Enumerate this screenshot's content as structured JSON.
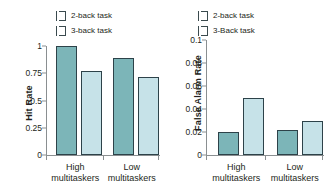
{
  "chart_data": [
    {
      "id": "hit-rate",
      "type": "bar",
      "title": "",
      "xlabel": "",
      "ylabel": "Hit Rate",
      "categories": [
        "High multitaskers",
        "Low multitaskers"
      ],
      "category_lines": [
        [
          "High",
          "multitaskers"
        ],
        [
          "Low",
          "multitaskers"
        ]
      ],
      "series": [
        {
          "name": "2-back task",
          "color": "#7cb5b8",
          "values": [
            1.0,
            0.89
          ]
        },
        {
          "name": "3-back task",
          "color": "#c6e2e8",
          "values": [
            0.77,
            0.72
          ]
        }
      ],
      "ylim": [
        0,
        1
      ],
      "yticks": [
        0,
        0.25,
        0.5,
        0.75,
        1
      ],
      "ytick_labels": [
        "0",
        "0.25",
        "0.5",
        "0.75",
        "1"
      ],
      "grid": false,
      "legend_position": "top"
    },
    {
      "id": "false-alarm-rate",
      "type": "bar",
      "title": "",
      "xlabel": "",
      "ylabel": "False Alarm Rate",
      "categories": [
        "High multitaskers",
        "Low multitaskers"
      ],
      "category_lines": [
        [
          "High",
          "multitaskers"
        ],
        [
          "Low",
          "multitaskers"
        ]
      ],
      "series": [
        {
          "name": "2-back task",
          "color": "#7cb5b8",
          "values": [
            0.02,
            0.022
          ]
        },
        {
          "name": "3-Back task",
          "color": "#c6e2e8",
          "values": [
            0.05,
            0.03
          ]
        }
      ],
      "ylim": [
        0,
        0.1
      ],
      "yticks": [
        0,
        0.02,
        0.04,
        0.06,
        0.08,
        0.1
      ],
      "ytick_labels": [
        "0",
        "0.02",
        "0.04",
        "0.06",
        "0.08",
        "0.1"
      ],
      "grid": false,
      "legend_position": "top"
    }
  ],
  "left": {
    "ylabel": "Hit Rate",
    "legend": [
      {
        "label": "2-back task",
        "color": "#7cb5b8"
      },
      {
        "label": "3-back task",
        "color": "#c6e2e8"
      }
    ],
    "ytick_labels": [
      "1",
      "0.75",
      "0.5",
      "0.25",
      "0"
    ],
    "groups": [
      {
        "line1": "High",
        "line2": "multitaskers"
      },
      {
        "line1": "Low",
        "line2": "multitaskers"
      }
    ]
  },
  "right": {
    "ylabel": "False Alarm Rate",
    "legend": [
      {
        "label": "2-back task",
        "color": "#7cb5b8"
      },
      {
        "label": "3-Back task",
        "color": "#c6e2e8"
      }
    ],
    "ytick_labels": [
      "0.1",
      "0.08",
      "0.06",
      "0.04",
      "0.02",
      "0"
    ],
    "groups": [
      {
        "line1": "High",
        "line2": "multitaskers"
      },
      {
        "line1": "Low",
        "line2": "multitaskers"
      }
    ]
  },
  "colors": {
    "series_2back": "#7cb5b8",
    "series_3back": "#c6e2e8",
    "bar_outline": "#2d4249",
    "axis": "#8a8f91",
    "text": "#231f20",
    "background": "#ffffff"
  }
}
